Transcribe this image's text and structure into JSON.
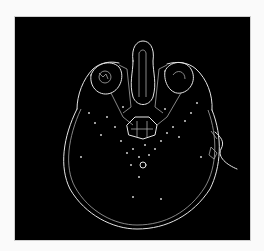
{
  "image": {
    "description": "Edge-detected axial head scan (skull outline with orbits, nasal structures and brainstem region) rendered as light lines on a black background",
    "background_color": "#000000",
    "edge_color": "#e6e6e6",
    "page_background": "#fafafa"
  }
}
